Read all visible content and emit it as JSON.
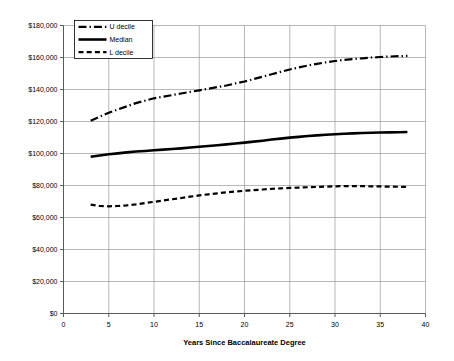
{
  "chart_data": {
    "type": "line",
    "title": "",
    "xlabel": "Years Since Baccalaureate Degree",
    "ylabel": "",
    "xlim": [
      0,
      40
    ],
    "ylim": [
      0,
      180000
    ],
    "grid": true,
    "legend_position": "top-left-inside",
    "x_ticks": [
      0,
      5,
      10,
      15,
      20,
      25,
      30,
      35,
      40
    ],
    "x_tick_labels": [
      "0",
      "5",
      "10",
      "15",
      "20",
      "25",
      "30",
      "35",
      "40"
    ],
    "y_ticks": [
      0,
      20000,
      40000,
      60000,
      80000,
      100000,
      120000,
      140000,
      160000,
      180000
    ],
    "y_tick_labels": [
      "$0",
      "$20,000",
      "$40,000",
      "$60,000",
      "$80,000",
      "$100,000",
      "$120,000",
      "$140,000",
      "$160,000",
      "$180,000"
    ],
    "x": [
      3,
      4,
      5,
      6,
      7,
      8,
      9,
      10,
      11,
      12,
      13,
      14,
      15,
      16,
      17,
      18,
      19,
      20,
      21,
      22,
      23,
      24,
      25,
      26,
      27,
      28,
      29,
      30,
      31,
      32,
      33,
      34,
      35,
      36,
      37,
      38
    ],
    "series": [
      {
        "name": "U decile",
        "style": "dash-dot",
        "color": "#000000",
        "width": 2.2,
        "values": [
          120500,
          123000,
          125500,
          127500,
          129500,
          131500,
          133000,
          134500,
          135500,
          136500,
          137500,
          138500,
          139500,
          140500,
          141500,
          142500,
          143800,
          145000,
          146500,
          148000,
          149500,
          151000,
          152500,
          153800,
          155000,
          156000,
          157000,
          157800,
          158500,
          159000,
          159500,
          160000,
          160300,
          160600,
          160800,
          161000
        ]
      },
      {
        "name": "Median",
        "style": "solid",
        "color": "#000000",
        "width": 2.6,
        "values": [
          98000,
          98800,
          99500,
          100100,
          100700,
          101200,
          101600,
          102000,
          102400,
          102800,
          103200,
          103700,
          104200,
          104700,
          105200,
          105700,
          106200,
          106800,
          107400,
          108000,
          108700,
          109300,
          109900,
          110400,
          110900,
          111300,
          111700,
          112000,
          112300,
          112600,
          112800,
          113000,
          113100,
          113200,
          113300,
          113400
        ]
      },
      {
        "name": "L decile",
        "style": "dashed",
        "color": "#000000",
        "width": 2.2,
        "values": [
          68000,
          67200,
          67000,
          67200,
          67600,
          68200,
          69000,
          69800,
          70600,
          71400,
          72200,
          73000,
          73800,
          74500,
          75100,
          75700,
          76200,
          76700,
          77100,
          77500,
          77900,
          78200,
          78500,
          78700,
          78900,
          79100,
          79300,
          79500,
          79600,
          79600,
          79600,
          79500,
          79400,
          79300,
          79200,
          79100
        ]
      }
    ],
    "legend": [
      {
        "label": "U decile",
        "style": "dash-dot"
      },
      {
        "label": "Median",
        "style": "solid"
      },
      {
        "label": "L decile",
        "style": "dashed"
      }
    ]
  }
}
